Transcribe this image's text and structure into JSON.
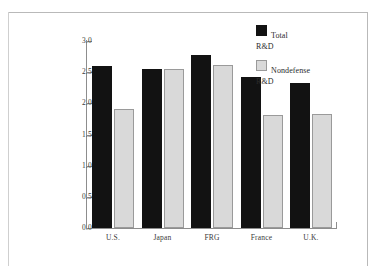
{
  "figure": {
    "background_color": "#ffffff",
    "frame_color": "#b9b9b9"
  },
  "legend": {
    "position": "top-right",
    "entries": [
      {
        "swatch": "black-square-icon",
        "color": "#121212",
        "line1": "Total",
        "line2": "R&D"
      },
      {
        "swatch": "gray-square-icon",
        "color": "#d9d9d9",
        "line1": "Nondefense",
        "line2": "R&D"
      }
    ]
  },
  "axis": {
    "y_ticks": [
      "0.0",
      "0.5",
      "1.0",
      "1.5",
      "2.0",
      "2.5",
      "3.0"
    ],
    "x_categories": [
      "U.S.",
      "Japan",
      "FRG",
      "France",
      "U.K."
    ]
  },
  "chart_data": {
    "type": "bar",
    "title": "",
    "subtitle": "",
    "xlabel": "",
    "ylabel": "",
    "ylim": [
      0.0,
      3.0
    ],
    "ytick_step": 0.5,
    "grid": false,
    "legend_position": "top-right",
    "categories": [
      "U.S.",
      "Japan",
      "FRG",
      "France",
      "U.K."
    ],
    "series": [
      {
        "name": "Total R&D",
        "color": "#121212",
        "values": [
          2.6,
          2.55,
          2.77,
          2.43,
          2.33
        ]
      },
      {
        "name": "Nondefense R&D",
        "color": "#d9d9d9",
        "values": [
          1.91,
          2.55,
          2.62,
          1.82,
          1.83
        ]
      }
    ]
  }
}
